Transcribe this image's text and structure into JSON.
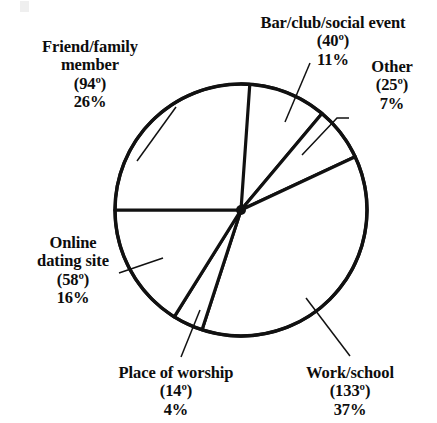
{
  "chart_data": {
    "type": "pie",
    "title": "",
    "xlabel": "",
    "ylabel": "",
    "legend_position": "none",
    "grid": false,
    "start_angle_deg": 0,
    "direction": "clockwise",
    "center": {
      "x": 241,
      "y": 210
    },
    "radius": 126,
    "stroke_color": "#111111",
    "fill_color": "#ffffff",
    "categories": [
      "Bar/club/social event",
      "Other",
      "Work/school",
      "Place of worship",
      "Online dating site",
      "Friend/family member"
    ],
    "values_degrees": [
      40,
      25,
      133,
      14,
      58,
      94
    ],
    "values_percent": [
      11,
      7,
      37,
      4,
      16,
      26
    ],
    "slices": [
      {
        "name": "bar-club-social-event",
        "label_line1": "Bar/club/social event",
        "degrees_text": "(40º)",
        "percent_text": "11%",
        "degrees": 40,
        "percent": 11,
        "start_deg": 0,
        "end_deg": 40
      },
      {
        "name": "other",
        "label_line1": "Other",
        "degrees_text": "(25º)",
        "percent_text": "7%",
        "degrees": 25,
        "percent": 7,
        "start_deg": 40,
        "end_deg": 65
      },
      {
        "name": "work-school",
        "label_line1": "Work/school",
        "degrees_text": "(133º)",
        "percent_text": "37%",
        "degrees": 133,
        "percent": 37,
        "start_deg": 65,
        "end_deg": 198
      },
      {
        "name": "place-of-worship",
        "label_line1": "Place of worship",
        "degrees_text": "(14º)",
        "percent_text": "4%",
        "degrees": 14,
        "percent": 4,
        "start_deg": 198,
        "end_deg": 212
      },
      {
        "name": "online-dating-site",
        "label_line1": "Online",
        "label_line2": "dating site",
        "degrees_text": "(58º)",
        "percent_text": "16%",
        "degrees": 58,
        "percent": 16,
        "start_deg": 212,
        "end_deg": 270
      },
      {
        "name": "friend-family-member",
        "label_line1": "Friend/family",
        "label_line2": "member",
        "degrees_text": "(94º)",
        "percent_text": "26%",
        "degrees": 94,
        "percent": 26,
        "start_deg": 270,
        "end_deg": 364
      }
    ],
    "leader_lines": [
      {
        "name": "bar-club-leader",
        "x1": 310,
        "y1": 63,
        "x2": 285,
        "y2": 122
      },
      {
        "name": "other-leader",
        "x1": 302,
        "y1": 155,
        "x2": 337,
        "y2": 118,
        "x3": 349,
        "y3": 118
      },
      {
        "name": "friend-family-leader",
        "x1": 137,
        "y1": 161,
        "x2": 176,
        "y2": 107
      },
      {
        "name": "online-dating-leader",
        "x1": 119,
        "y1": 273,
        "x2": 163,
        "y2": 258
      },
      {
        "name": "place-of-worship-leader",
        "x1": 181,
        "y1": 357,
        "x2": 200,
        "y2": 310
      },
      {
        "name": "work-school-leader",
        "x1": 350,
        "y1": 356,
        "x2": 306,
        "y2": 298
      }
    ]
  }
}
